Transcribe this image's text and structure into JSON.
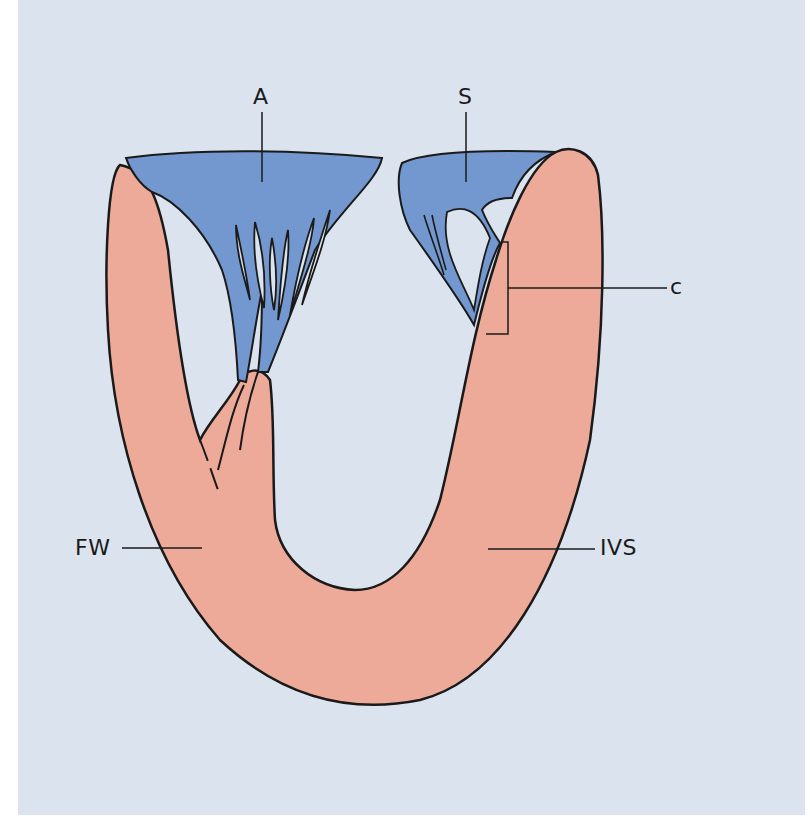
{
  "figure": {
    "background_color": "#dbe3ee",
    "myocardium_color": "#eeaa98",
    "valve_color": "#7397cf",
    "outline_color": "#1a1a1a"
  },
  "labels": {
    "anterior_leaflet": "A",
    "septal_leaflet": "S",
    "chordae": "c",
    "free_wall": "FW",
    "interventricular_septum": "IVS"
  }
}
